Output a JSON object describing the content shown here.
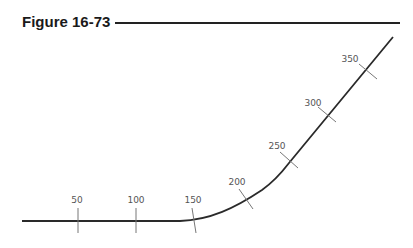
{
  "figure": {
    "title": "Figure 16-73"
  },
  "diagram": {
    "line_color": "#2a2a2a",
    "tick_color": "#777777",
    "stations": [
      {
        "label": "50",
        "value": 50
      },
      {
        "label": "100",
        "value": 100
      },
      {
        "label": "150",
        "value": 150
      },
      {
        "label": "200",
        "value": 200
      },
      {
        "label": "250",
        "value": 250
      },
      {
        "label": "300",
        "value": 300
      },
      {
        "label": "350",
        "value": 350
      }
    ]
  }
}
